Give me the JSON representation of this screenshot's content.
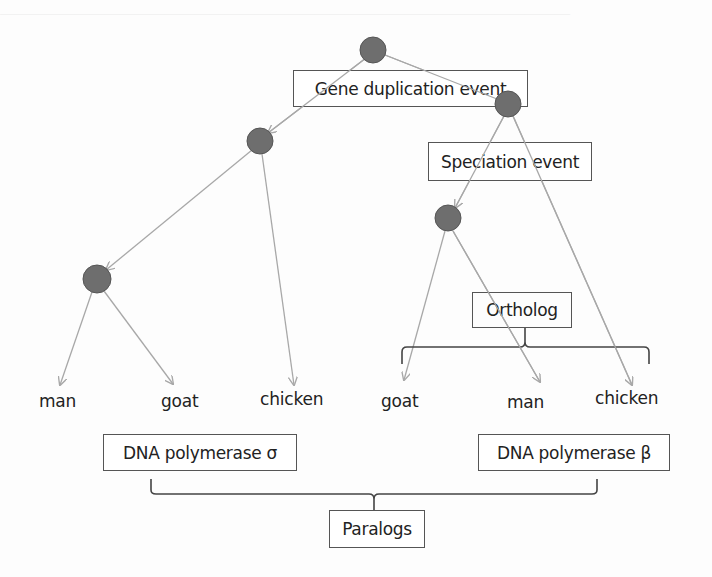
{
  "diagram": {
    "labels": {
      "gene_duplication": "Gene duplication event",
      "speciation": "Speciation event",
      "ortholog": "Ortholog",
      "paralogs": "Paralogs",
      "dna_pol_sigma": "DNA polymerase σ",
      "dna_pol_beta": "DNA polymerase β"
    },
    "leaves_left": [
      "man",
      "goat",
      "chicken"
    ],
    "leaves_right": [
      "goat",
      "man",
      "chicken"
    ],
    "colors": {
      "node_fill": "#6e6e6e",
      "node_stroke": "#555555",
      "edge": "#a8a8a8",
      "bracket": "#444444",
      "box_border": "#555555"
    },
    "nodes": [
      {
        "id": "root",
        "x": 373,
        "y": 50
      },
      {
        "id": "duplicate-left",
        "x": 260,
        "y": 141
      },
      {
        "id": "duplicate-right",
        "x": 508,
        "y": 104
      },
      {
        "id": "speciation-left",
        "x": 97,
        "y": 279
      },
      {
        "id": "speciation-right",
        "x": 448,
        "y": 218
      }
    ]
  }
}
